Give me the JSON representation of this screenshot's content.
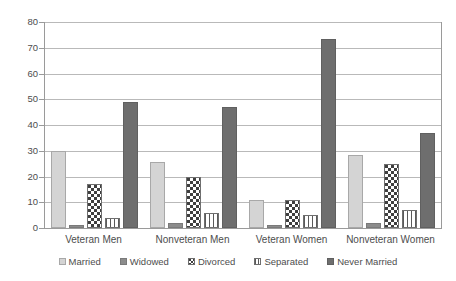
{
  "chart_data": {
    "type": "bar",
    "title": "",
    "subtitle": "",
    "xlabel": "",
    "ylabel": "",
    "ylim": [
      0,
      80
    ],
    "yticks": [
      0,
      10,
      20,
      30,
      40,
      50,
      60,
      70,
      80
    ],
    "grid": "horizontal",
    "legend_position": "bottom",
    "categories": [
      "Veteran Men",
      "Nonveteran Men",
      "Veteran Women",
      "Nonveteran Women"
    ],
    "series": [
      {
        "name": "Married",
        "pattern": "solid-light",
        "color": "#d4d4d4",
        "values": [
          30.0,
          25.5,
          11.0,
          28.5
        ]
      },
      {
        "name": "Widowed",
        "pattern": "solid-medium",
        "color": "#8c8c8c",
        "values": [
          1.0,
          2.0,
          1.0,
          2.0
        ]
      },
      {
        "name": "Divorced",
        "pattern": "checkerboard",
        "color": "#3f3f3f",
        "values": [
          17.0,
          20.0,
          11.0,
          25.0
        ]
      },
      {
        "name": "Separated",
        "pattern": "vertical-stripes",
        "color": "#5a5a5a",
        "values": [
          4.0,
          6.0,
          5.0,
          7.0
        ]
      },
      {
        "name": "Never Married",
        "pattern": "solid-dark",
        "color": "#6e6e6e",
        "values": [
          49.0,
          47.0,
          73.5,
          37.0
        ]
      }
    ]
  }
}
